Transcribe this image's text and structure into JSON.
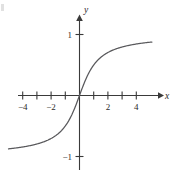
{
  "figure": {
    "title": "",
    "background_color": "#ffffff",
    "curve_color": "#59595c",
    "axis_color": "#3a3a3a",
    "text_color": "#2b2b2b",
    "corner_mark": "page-edge-artifact"
  },
  "chart_data": {
    "type": "line",
    "title": "",
    "xlabel": "x",
    "ylabel": "y",
    "xlim": [
      -5.0,
      5.1
    ],
    "ylim": [
      -1.25,
      1.25
    ],
    "grid": false,
    "legend": null,
    "xticks": [
      -4,
      -3,
      -2,
      -1,
      1,
      2,
      3,
      4
    ],
    "xtick_labels": [
      "−4",
      "",
      "−2",
      "",
      "",
      "2",
      "",
      "4"
    ],
    "yticks": [
      1,
      -1
    ],
    "ytick_labels": [
      "1",
      "−1"
    ],
    "asymptotes": [
      1,
      -1
    ],
    "series": [
      {
        "name": "y = (2/π) arctan(x)",
        "x": [
          -5.0,
          -4.75,
          -4.5,
          -4.25,
          -4.0,
          -3.75,
          -3.5,
          -3.25,
          -3.0,
          -2.75,
          -2.5,
          -2.25,
          -2.0,
          -1.75,
          -1.5,
          -1.25,
          -1.0,
          -0.85,
          -0.7,
          -0.55,
          -0.4,
          -0.25,
          -0.1,
          0.0,
          0.1,
          0.25,
          0.4,
          0.55,
          0.7,
          0.85,
          1.0,
          1.25,
          1.5,
          1.75,
          2.0,
          2.25,
          2.5,
          2.75,
          3.0,
          3.25,
          3.5,
          3.75,
          4.0,
          4.25,
          4.5,
          4.75,
          5.0
        ],
        "y": [
          -0.8743,
          -0.8686,
          -0.8623,
          -0.8554,
          -0.8478,
          -0.8394,
          -0.8302,
          -0.8199,
          -0.8086,
          -0.7958,
          -0.7814,
          -0.7652,
          -0.7048,
          -0.6833,
          -0.6529,
          -0.6107,
          -0.5,
          -0.4636,
          -0.422,
          -0.3744,
          -0.3222,
          -0.2048,
          -0.0635,
          0.0,
          0.0635,
          0.2048,
          0.3222,
          0.3744,
          0.422,
          0.4636,
          0.5,
          0.6107,
          0.6529,
          0.6833,
          0.7048,
          0.7652,
          0.7814,
          0.7958,
          0.8086,
          0.8199,
          0.8302,
          0.8394,
          0.8478,
          0.8554,
          0.8623,
          0.8686,
          0.8743
        ]
      }
    ]
  },
  "labels": {
    "y_axis": "y",
    "x_axis": "x",
    "y_tick_pos_one": "1",
    "y_tick_neg_one": "−1",
    "x_tick_neg_four": "−4",
    "x_tick_neg_two": "−2",
    "x_tick_pos_two": "2",
    "x_tick_pos_four": "4"
  }
}
